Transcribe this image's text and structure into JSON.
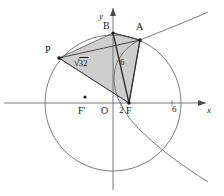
{
  "figure": {
    "canvas": {
      "width": 224,
      "height": 196
    },
    "colors": {
      "stroke": "#4a4a4a",
      "axis": "#6b6b6b",
      "chord_stroke": "#2b2b2b",
      "fill": "#c9c9c9",
      "fill_opacity": "0.85",
      "text": "#1a1a1a",
      "background": "#ffffff"
    },
    "axes": {
      "x_label": "x",
      "y_label": "y",
      "origin_label": "O",
      "x_axis_y_px": 103,
      "y_axis_x_px": 113
    },
    "ticks": [
      {
        "name": "tick-2",
        "label": "2",
        "x_px": 120,
        "y_px": 112
      },
      {
        "name": "tick-6",
        "label": "6",
        "x_px": 174,
        "y_px": 112
      }
    ],
    "points": [
      {
        "name": "point-B",
        "label": "B",
        "x_px": 113,
        "y_px": 33,
        "label_x": 103,
        "label_y": 22,
        "dot": false
      },
      {
        "name": "point-A",
        "label": "A",
        "x_px": 140,
        "y_px": 40,
        "label_x": 137,
        "label_y": 25,
        "dot": true
      },
      {
        "name": "point-P",
        "label": "P",
        "x_px": 59,
        "y_px": 58,
        "label_x": 46,
        "label_y": 47,
        "dot": true
      },
      {
        "name": "point-F",
        "label": "F",
        "x_px": 129,
        "y_px": 103,
        "label_x": 127,
        "label_y": 108,
        "dot": true
      },
      {
        "name": "point-F-prime",
        "label": "F′",
        "x_px": 85,
        "y_px": 97,
        "label_x": 78,
        "label_y": 108,
        "dot": true
      }
    ],
    "measurements": [
      {
        "name": "label-sqrt32",
        "prefix": "√",
        "value": "32",
        "text": "√32",
        "x_px": 78,
        "y_px": 62
      },
      {
        "name": "label-six",
        "text": "6",
        "x_px": 122,
        "y_px": 62
      }
    ],
    "circle": {
      "name": "circle-curve",
      "cx_px": 113,
      "cy_px": 103,
      "r_px": 68
    },
    "parabola": {
      "name": "parabola-curve",
      "description": "right-opening conic branch passing through A and descending to lower right"
    },
    "quadrilateral": {
      "name": "shaded-quadrilateral-PBAF",
      "vertices": [
        "P",
        "B",
        "A",
        "F"
      ]
    },
    "diagonals": [
      {
        "name": "segment-B-F",
        "from": "B",
        "to": "F"
      },
      {
        "name": "segment-P-A",
        "from": "P",
        "to": "A"
      },
      {
        "name": "segment-A-F",
        "from": "A",
        "to": "F"
      }
    ]
  }
}
